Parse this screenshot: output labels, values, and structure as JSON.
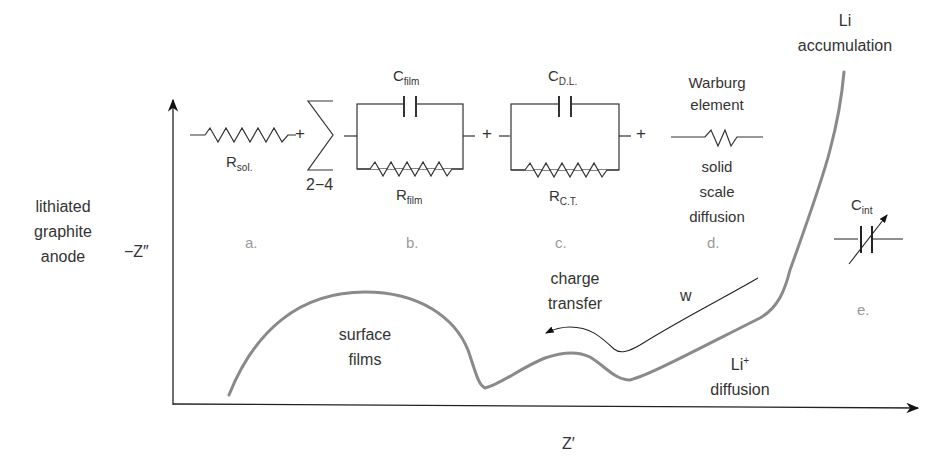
{
  "diagram": {
    "electrode_label": [
      "lithiated",
      "graphite",
      "anode"
    ],
    "axes": {
      "y_label": "−Z″",
      "x_label": "Z′"
    },
    "circuit": {
      "r_sol": {
        "main": "R",
        "sub": "sol."
      },
      "plus": "+",
      "sum_range": "2−4",
      "c_film": {
        "main": "C",
        "sub": "film"
      },
      "r_film": {
        "main": "R",
        "sub": "film"
      },
      "c_dl": {
        "main": "C",
        "sub": "D.L."
      },
      "r_ct": {
        "main": "R",
        "sub": "C.T."
      },
      "warburg_title": [
        "Warburg",
        "element"
      ],
      "warburg_desc": [
        "solid",
        "scale",
        "diffusion"
      ],
      "c_int": {
        "main": "C",
        "sub": "int"
      }
    },
    "element_letters": [
      "a.",
      "b.",
      "c.",
      "d.",
      "e."
    ],
    "curve_labels": {
      "surface_films": [
        "surface",
        "films"
      ],
      "charge_transfer": [
        "charge",
        "transfer"
      ],
      "w": "w",
      "li_diffusion_main": "Li",
      "li_diffusion_sup": "+",
      "li_diffusion_word": "diffusion",
      "li_accumulation": [
        "Li",
        "accumulation"
      ]
    },
    "colors": {
      "curve": "#8a8a8a",
      "axis": "#222222",
      "letters": "#9a9a9a"
    }
  }
}
